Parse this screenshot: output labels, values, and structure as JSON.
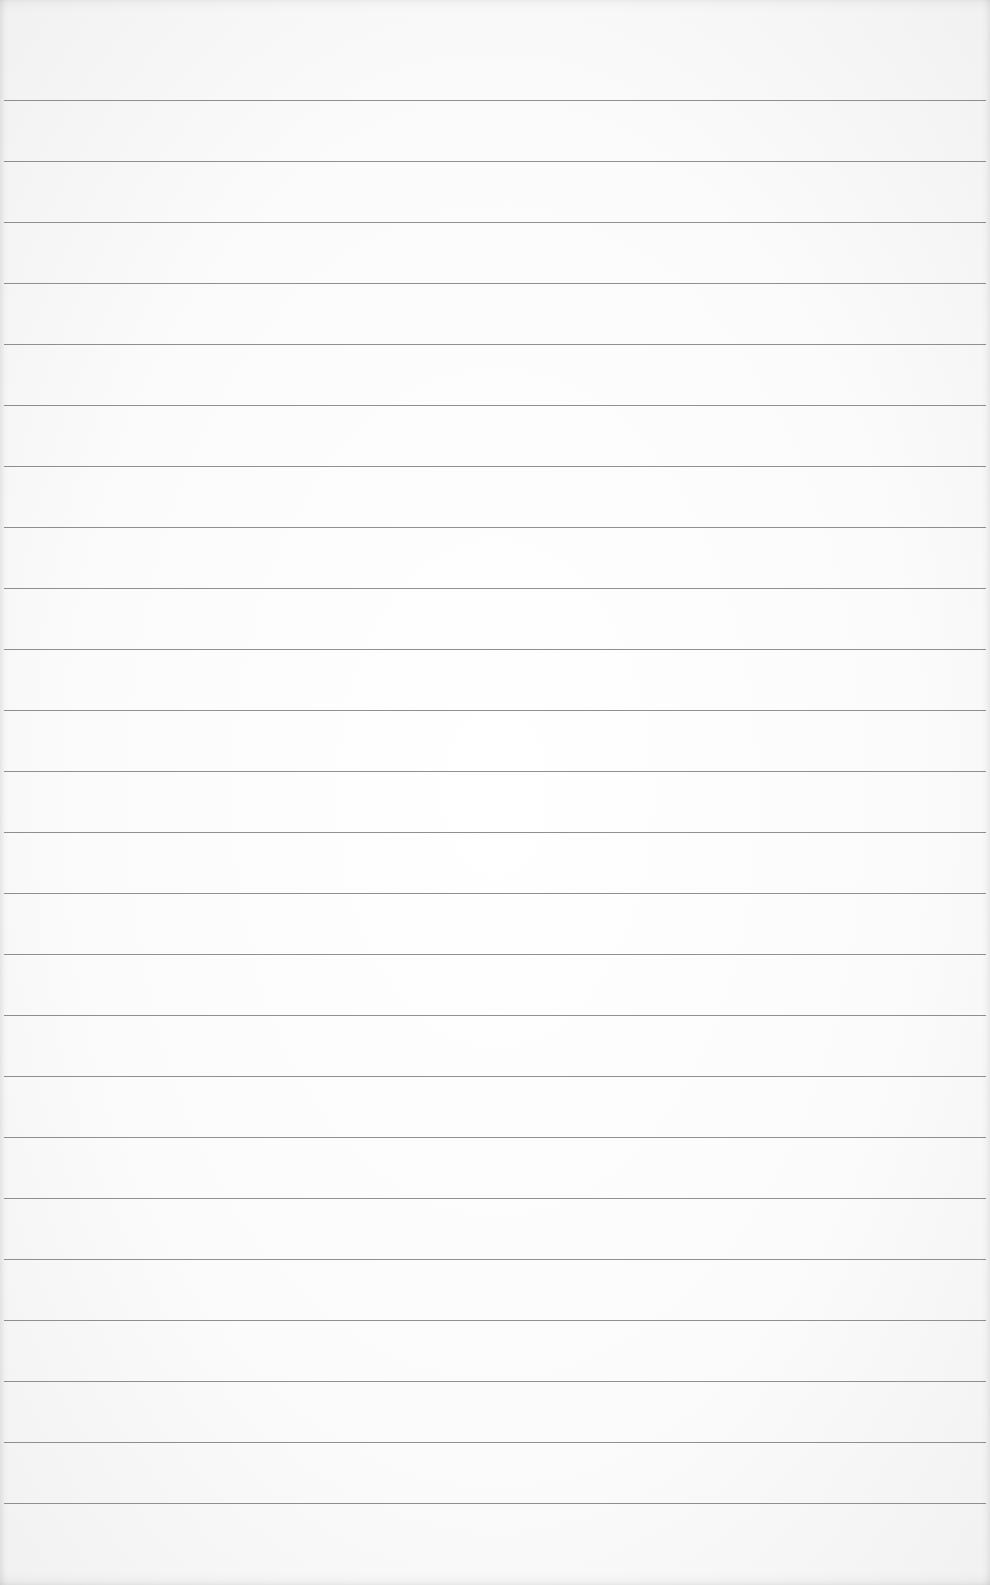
{
  "sheet": {
    "type": "ruled-paper",
    "background_color": "#fbfbfb",
    "rule_color": "#7d7d7d",
    "rule_count": 24,
    "first_rule_y": 100,
    "rule_spacing": 61,
    "text": ""
  }
}
